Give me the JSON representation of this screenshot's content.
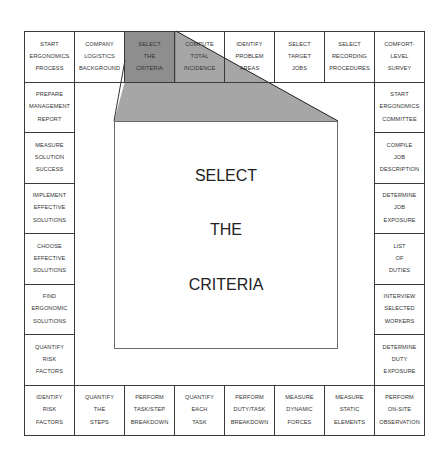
{
  "diagram": {
    "highlighted_step": "SELECT THE CRITERIA",
    "colors": {
      "border": "#3a3a3a",
      "highlight": "#8f8f8f",
      "highlight_light": "#a8a8a8",
      "text": "#333333"
    },
    "top_row": [
      {
        "lines": [
          "START",
          "ERGONOMICS",
          "PROCESS"
        ]
      },
      {
        "lines": [
          "COMPANY",
          "LOGISTICS",
          "BACKGROUND"
        ]
      },
      {
        "lines": [
          "SELECT",
          "THE",
          "CRITERIA"
        ]
      },
      {
        "lines": [
          "COMPUTE",
          "TOTAL",
          "INCIDENCE"
        ]
      },
      {
        "lines": [
          "IDENTIFY",
          "PROBLEM",
          "AREAS"
        ]
      },
      {
        "lines": [
          "SELECT",
          "TARGET",
          "JOBS"
        ]
      },
      {
        "lines": [
          "SELECT",
          "RECORDING",
          "PROCEDURES"
        ]
      },
      {
        "lines": [
          "COMFORT-",
          "LEVEL",
          "SURVEY"
        ]
      }
    ],
    "right_column": [
      {
        "lines": [
          "START",
          "ERGONOMICS",
          "COMMITTEE"
        ]
      },
      {
        "lines": [
          "COMPILE",
          "JOB",
          "DESCRIPTION"
        ]
      },
      {
        "lines": [
          "DETERMINE",
          "JOB",
          "EXPOSURE"
        ]
      },
      {
        "lines": [
          "LIST",
          "OF",
          "DUTIES"
        ]
      },
      {
        "lines": [
          "INTERVIEW",
          "SELECTED",
          "WORKERS"
        ]
      },
      {
        "lines": [
          "DETERMINE",
          "DUTY",
          "EXPOSURE"
        ]
      }
    ],
    "bottom_row": [
      {
        "lines": [
          "IDENTIFY",
          "RISK",
          "FACTORS"
        ]
      },
      {
        "lines": [
          "QUANTIFY",
          "THE",
          "STEPS"
        ]
      },
      {
        "lines": [
          "PERFORM",
          "TASK/STEP",
          "BREAKDOWN"
        ]
      },
      {
        "lines": [
          "QUANTIFY",
          "EACH",
          "TASK"
        ]
      },
      {
        "lines": [
          "PERFORM",
          "DUTY/TASK",
          "BREAKDOWN"
        ]
      },
      {
        "lines": [
          "MEASURE",
          "DYNAMIC",
          "FORCES"
        ]
      },
      {
        "lines": [
          "MEASURE",
          "STATIC",
          "ELEMENTS"
        ]
      },
      {
        "lines": [
          "PERFORM",
          "ON-SITE",
          "OBSERVATION"
        ]
      }
    ],
    "left_column": [
      {
        "lines": [
          "PREPARE",
          "MANAGEMENT",
          "REPORT"
        ]
      },
      {
        "lines": [
          "MEASURE",
          "SOLUTION",
          "SUCCESS"
        ]
      },
      {
        "lines": [
          "IMPLEMENT",
          "EFFECTIVE",
          "SOLUTIONS"
        ]
      },
      {
        "lines": [
          "CHOOSE",
          "EFFECTIVE",
          "SOLUTIONS"
        ]
      },
      {
        "lines": [
          "FIND",
          "ERGONOMIC",
          "SOLUTIONS"
        ]
      },
      {
        "lines": [
          "QUANTIFY",
          "RISK",
          "FACTORS"
        ]
      }
    ],
    "center": {
      "lines": [
        "SELECT",
        "THE",
        "CRITERIA"
      ]
    }
  }
}
